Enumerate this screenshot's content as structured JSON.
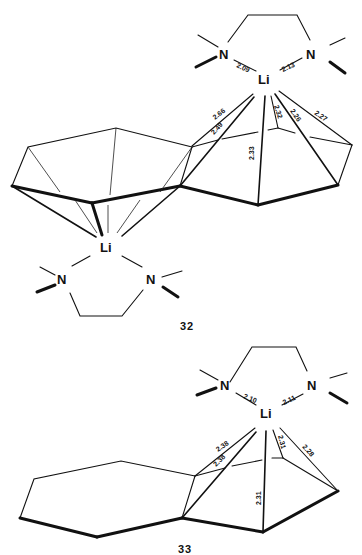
{
  "structures": [
    {
      "label": "32",
      "top_complex": {
        "atoms": [
          "N",
          "Li",
          "N"
        ],
        "bonds": {
          "N1_Li": "2.09",
          "N2_Li": "2.13",
          "Li_C_a": "2.66",
          "Li_C_b": "2.49",
          "Li_C_c": "2.32",
          "Li_C_d": "2.26",
          "Li_C_e": "2.27",
          "Li_C_f": "2.33"
        }
      },
      "bottom_complex": {
        "atoms": [
          "Li",
          "N",
          "N"
        ]
      }
    },
    {
      "label": "33",
      "top_complex": {
        "atoms": [
          "N",
          "Li",
          "N"
        ],
        "bonds": {
          "N1_Li": "2.10",
          "N2_Li": "2.11",
          "Li_C_a": "2.38",
          "Li_C_b": "2.38",
          "Li_C_c": "2.31",
          "Li_C_d": "2.28",
          "Li_C_e": "2.31"
        }
      }
    }
  ]
}
